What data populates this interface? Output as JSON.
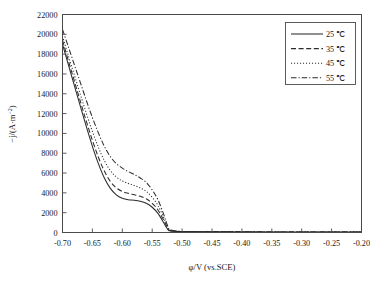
{
  "chart_data": {
    "type": "line",
    "title": "",
    "xlabel": "φ/V (vs.SCE)",
    "ylabel_parts": {
      "prefix": "−j/(A·m",
      "sup": "−2",
      "suffix": ")"
    },
    "ylabel": "−j/(A·m−2)",
    "xlim": [
      -0.7,
      -0.2
    ],
    "ylim": [
      0,
      22000
    ],
    "xticks": [
      -0.7,
      -0.65,
      -0.6,
      -0.55,
      -0.5,
      -0.45,
      -0.4,
      -0.35,
      -0.3,
      -0.25,
      -0.2
    ],
    "xticklabels": [
      "-0.70",
      "-0.65",
      "-0.60",
      "-0.55",
      "-0.50",
      "-0.45",
      "-0.40",
      "-0.35",
      "-0.30",
      "-0.25",
      "-0.20"
    ],
    "yticks": [
      0,
      2000,
      4000,
      6000,
      8000,
      10000,
      12000,
      14000,
      16000,
      18000,
      20000,
      22000
    ],
    "yticklabels": [
      "0",
      "2000",
      "4000",
      "6000",
      "8000",
      "10000",
      "12000",
      "14000",
      "16000",
      "18000",
      "20000",
      "22000"
    ],
    "grid": false,
    "legend_position": "upper right",
    "series": [
      {
        "name": "25 ℃",
        "style": "solid",
        "x": [
          -0.7,
          -0.69,
          -0.68,
          -0.67,
          -0.66,
          -0.65,
          -0.64,
          -0.63,
          -0.62,
          -0.61,
          -0.6,
          -0.59,
          -0.58,
          -0.57,
          -0.56,
          -0.55,
          -0.54,
          -0.53,
          -0.525,
          -0.52,
          -0.5,
          -0.45,
          -0.4,
          -0.35,
          -0.3,
          -0.25,
          -0.2
        ],
        "y": [
          19000,
          16900,
          14800,
          12700,
          10650,
          8700,
          6950,
          5500,
          4450,
          3800,
          3450,
          3300,
          3250,
          3150,
          2950,
          2550,
          1900,
          900,
          400,
          150,
          90,
          70,
          60,
          55,
          50,
          45,
          40
        ]
      },
      {
        "name": "35 ℃",
        "style": "dashed",
        "x": [
          -0.7,
          -0.69,
          -0.68,
          -0.67,
          -0.66,
          -0.65,
          -0.64,
          -0.63,
          -0.62,
          -0.61,
          -0.6,
          -0.59,
          -0.58,
          -0.57,
          -0.56,
          -0.55,
          -0.54,
          -0.53,
          -0.525,
          -0.52,
          -0.5,
          -0.45,
          -0.4,
          -0.35,
          -0.3,
          -0.25,
          -0.2
        ],
        "y": [
          19400,
          17300,
          15250,
          13200,
          11200,
          9300,
          7600,
          6200,
          5150,
          4500,
          4150,
          3950,
          3800,
          3650,
          3400,
          2950,
          2250,
          1150,
          550,
          200,
          95,
          72,
          62,
          56,
          51,
          46,
          41
        ]
      },
      {
        "name": "45 ℃",
        "style": "dotted",
        "x": [
          -0.7,
          -0.69,
          -0.68,
          -0.67,
          -0.66,
          -0.65,
          -0.64,
          -0.63,
          -0.62,
          -0.61,
          -0.6,
          -0.59,
          -0.58,
          -0.57,
          -0.56,
          -0.55,
          -0.54,
          -0.53,
          -0.525,
          -0.52,
          -0.5,
          -0.45,
          -0.4,
          -0.35,
          -0.3,
          -0.25,
          -0.2
        ],
        "y": [
          19800,
          17800,
          15850,
          13900,
          12000,
          10200,
          8600,
          7250,
          6250,
          5600,
          5200,
          4950,
          4750,
          4500,
          4150,
          3550,
          2700,
          1400,
          680,
          240,
          100,
          75,
          64,
          58,
          52,
          47,
          42
        ]
      },
      {
        "name": "55 ℃",
        "style": "dashdot",
        "x": [
          -0.7,
          -0.69,
          -0.68,
          -0.67,
          -0.66,
          -0.65,
          -0.64,
          -0.63,
          -0.62,
          -0.61,
          -0.6,
          -0.59,
          -0.58,
          -0.57,
          -0.56,
          -0.55,
          -0.54,
          -0.53,
          -0.525,
          -0.52,
          -0.5,
          -0.45,
          -0.4,
          -0.35,
          -0.3,
          -0.25,
          -0.2
        ],
        "y": [
          20500,
          18700,
          16900,
          15100,
          13300,
          11600,
          10050,
          8700,
          7650,
          6950,
          6500,
          6150,
          5850,
          5500,
          5050,
          4300,
          3250,
          1700,
          800,
          280,
          105,
          78,
          66,
          59,
          53,
          48,
          43
        ]
      }
    ],
    "legend": [
      {
        "label": "25 ℃",
        "style": "solid"
      },
      {
        "label": "35 ℃",
        "style": "dashed"
      },
      {
        "label": "45 ℃",
        "style": "dotted"
      },
      {
        "label": "55 ℃",
        "style": "dashdot"
      }
    ],
    "colors": {
      "line": "#2b2b2b",
      "axis": "#4a4a4a",
      "background": "#ffffff"
    }
  }
}
